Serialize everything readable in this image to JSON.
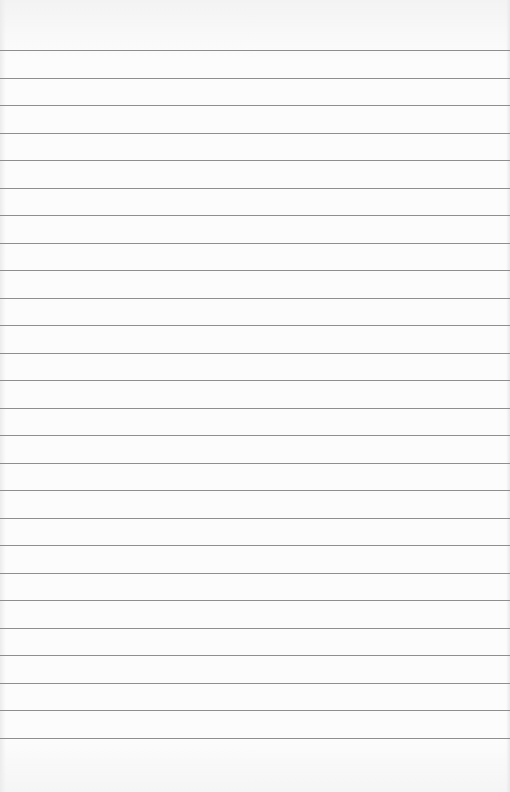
{
  "sheet": {
    "type": "lined-paper",
    "background_color": "#fcfcfc",
    "line_color": "#8e8e8e",
    "line_count": 26,
    "first_line_y": 50,
    "line_spacing": 27.5
  }
}
